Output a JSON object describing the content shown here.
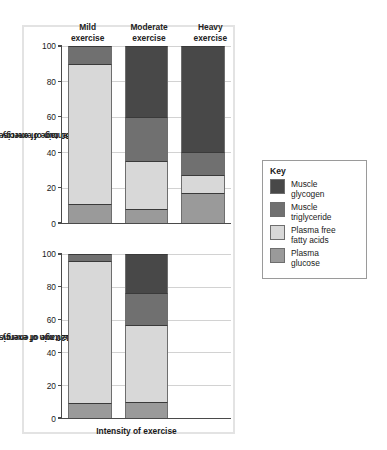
{
  "figure": {
    "xlabel": "Intensity of exercise",
    "panel_border_color": "#e3e3e3"
  },
  "columns": [
    {
      "line1": "Mild",
      "line2": "exercise"
    },
    {
      "line1": "Moderate",
      "line2": "exercise"
    },
    {
      "line1": "Heavy",
      "line2": "exercise"
    }
  ],
  "legend": {
    "title": "Key",
    "items": [
      {
        "label1": "Muscle",
        "label2": "glycogen",
        "color": "#484848",
        "key": "muscle_glycogen"
      },
      {
        "label1": "Muscle",
        "label2": "triglyceride",
        "color": "#707070",
        "key": "muscle_triglyceride"
      },
      {
        "label1": "Plasma free",
        "label2": "fatty acids",
        "color": "#d8d8d8",
        "key": "plasma_ffa"
      },
      {
        "label1": "Plasma",
        "label2": "glucose",
        "color": "#9a9a9a",
        "key": "plasma_glucose"
      }
    ]
  },
  "chart_data": [
    {
      "type": "bar",
      "stacked": true,
      "id": "top",
      "title": "",
      "ylabel": "Percentage of energy expenditure\n0–30 min of exercise",
      "ylabel_line1": "Percentage of energy expenditure",
      "ylabel_line2": "0–30 min of exercise",
      "xlabel": "",
      "categories": [
        "Mild exercise",
        "Moderate exercise",
        "Heavy exercise"
      ],
      "ylim": [
        0,
        100
      ],
      "yticks": [
        0,
        20,
        40,
        60,
        80,
        100
      ],
      "ytick_labels": [
        "0",
        "20",
        "40",
        "60",
        "80",
        "100"
      ],
      "grid": true,
      "legend_position": "right-outside",
      "series": [
        {
          "name": "Plasma glucose",
          "color": "#9a9a9a",
          "values": [
            11,
            8,
            17
          ]
        },
        {
          "name": "Plasma free fatty acids",
          "color": "#d8d8d8",
          "values": [
            79,
            27,
            10
          ]
        },
        {
          "name": "Muscle triglyceride",
          "color": "#707070",
          "values": [
            10,
            25,
            13
          ]
        },
        {
          "name": "Muscle glycogen",
          "color": "#484848",
          "values": [
            0,
            40,
            60
          ]
        }
      ]
    },
    {
      "type": "bar",
      "stacked": true,
      "id": "bottom",
      "title": "",
      "ylabel": "Percentage of energy expenditure\n90–120 min of exercise",
      "ylabel_line1": "Percentage of energy expenditure",
      "ylabel_line2": "90–120 min of exercise",
      "xlabel": "Intensity of exercise",
      "categories": [
        "Mild exercise",
        "Moderate exercise",
        "Heavy exercise"
      ],
      "ylim": [
        0,
        100
      ],
      "yticks": [
        0,
        20,
        40,
        60,
        80,
        100
      ],
      "ytick_labels": [
        "0",
        "20",
        "40",
        "60",
        "80",
        "100"
      ],
      "grid": true,
      "legend_position": "right-outside",
      "series": [
        {
          "name": "Plasma glucose",
          "color": "#9a9a9a",
          "values": [
            9,
            10,
            null
          ]
        },
        {
          "name": "Plasma free fatty acids",
          "color": "#d8d8d8",
          "values": [
            87,
            47,
            null
          ]
        },
        {
          "name": "Muscle triglyceride",
          "color": "#707070",
          "values": [
            4,
            19,
            null
          ]
        },
        {
          "name": "Muscle glycogen",
          "color": "#484848",
          "values": [
            0,
            24,
            null
          ]
        }
      ]
    }
  ]
}
